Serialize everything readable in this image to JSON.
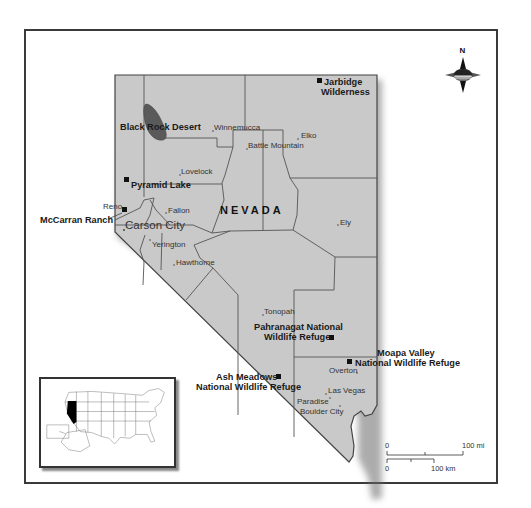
{
  "map": {
    "state_label": "NEVADA",
    "capital": {
      "name": "Carson City"
    },
    "cities": [
      {
        "name": "Winnemucca"
      },
      {
        "name": "Battle Mountain"
      },
      {
        "name": "Elko"
      },
      {
        "name": "Lovelock"
      },
      {
        "name": "Reno"
      },
      {
        "name": "Fallon"
      },
      {
        "name": "Ely"
      },
      {
        "name": "Yerington"
      },
      {
        "name": "Hawthorne"
      },
      {
        "name": "Tonopah"
      },
      {
        "name": "Overton"
      },
      {
        "name": "Las Vegas"
      },
      {
        "name": "Paradise"
      },
      {
        "name": "Boulder City"
      }
    ],
    "sites": [
      {
        "line1": "Jarbidge",
        "line2": "Wilderness"
      },
      {
        "line1": "Black Rock Desert"
      },
      {
        "line1": "Pyramid Lake"
      },
      {
        "line1": "McCarran Ranch"
      },
      {
        "line1": "Pahranagat National",
        "line2": "Wildlife Refuge"
      },
      {
        "line1": "Moapa Valley",
        "line2": "National Wildlife Refuge"
      },
      {
        "line1": "Ash Meadows",
        "line2": "National Wildlife Refuge"
      }
    ],
    "compass": {
      "label": "N"
    },
    "scale_bar": {
      "miles": {
        "start": "0",
        "end": "100 mi"
      },
      "km": {
        "start": "0",
        "end": "100 km"
      }
    },
    "inset": {
      "description": "United States locator map with Nevada highlighted"
    },
    "colors": {
      "land": "#c9c9c9",
      "desert": "#555555",
      "highlight": "#000000",
      "border": "#444444"
    }
  }
}
